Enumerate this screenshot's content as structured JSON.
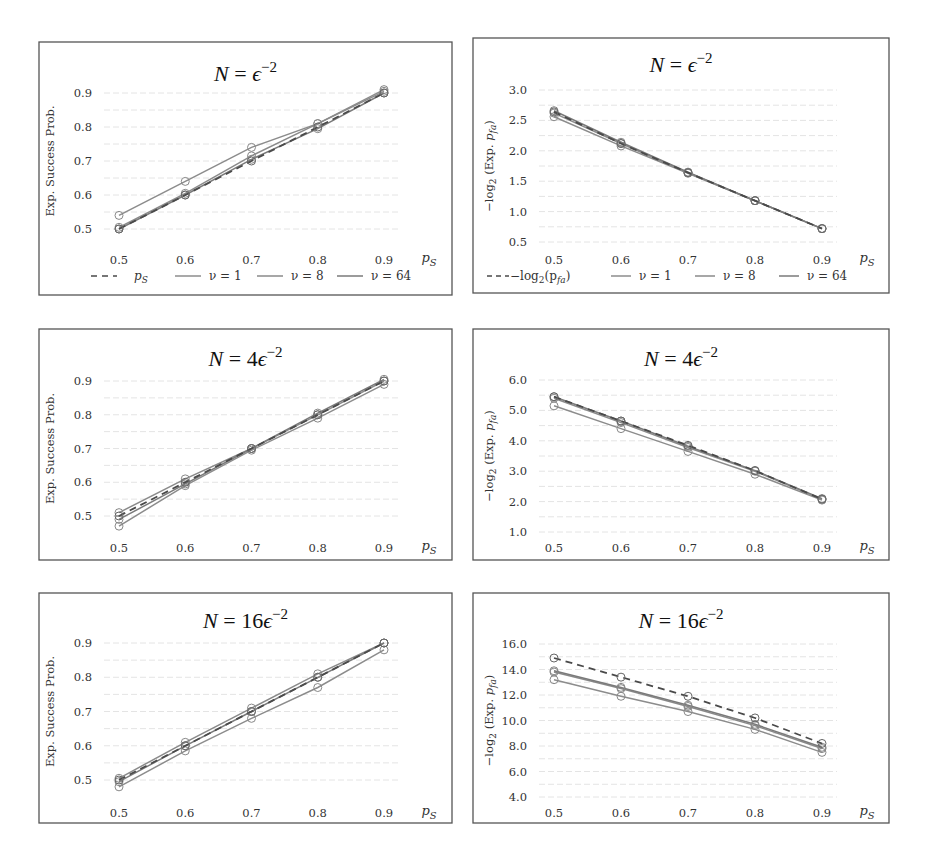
{
  "chart_data": [
    {
      "id": "success-eps2",
      "type": "line",
      "title": "N = ε^-2",
      "title_parts": {
        "lhs": "N",
        "eq": " = ",
        "coef": "",
        "sym": "ϵ",
        "exp": "−2"
      },
      "xlabel": "p_S",
      "ylabel": "Exp. Success Prob.",
      "x": [
        0.5,
        0.6,
        0.7,
        0.8,
        0.9
      ],
      "xticks": [
        "0.5",
        "0.6",
        "0.7",
        "0.8",
        "0.9"
      ],
      "yticks": [
        "0.5",
        "0.6",
        "0.7",
        "0.8",
        "0.9"
      ],
      "ylim": [
        0.45,
        0.95
      ],
      "grid": true,
      "legend_visible": true,
      "series": [
        {
          "name": "p_S",
          "style": "dashed",
          "values": [
            0.5,
            0.6,
            0.7,
            0.8,
            0.9
          ]
        },
        {
          "name": "ν = 1",
          "style": "solid",
          "values": [
            0.54,
            0.64,
            0.74,
            0.81,
            0.91
          ]
        },
        {
          "name": "ν = 8",
          "style": "solid",
          "values": [
            0.505,
            0.605,
            0.715,
            0.81,
            0.905
          ]
        },
        {
          "name": "ν = 64",
          "style": "solid",
          "values": [
            0.5,
            0.6,
            0.705,
            0.795,
            0.9
          ]
        }
      ]
    },
    {
      "id": "pfa-eps2",
      "type": "line",
      "title": "N = ε^-2",
      "title_parts": {
        "lhs": "N",
        "eq": " = ",
        "coef": "",
        "sym": "ϵ",
        "exp": "−2"
      },
      "xlabel": "p_S",
      "ylabel": "−log2 (Exp. p_fa)",
      "x": [
        0.5,
        0.6,
        0.7,
        0.8,
        0.9
      ],
      "xticks": [
        "0.5",
        "0.6",
        "0.7",
        "0.8",
        "0.9"
      ],
      "yticks": [
        "0.5",
        "1.0",
        "1.5",
        "2.0",
        "2.5",
        "3.0"
      ],
      "ylim": [
        0.5,
        3.0
      ],
      "grid": true,
      "legend_visible": true,
      "series": [
        {
          "name": "−log2(p_fa)",
          "style": "dashed",
          "values": [
            2.64,
            2.12,
            1.64,
            1.18,
            0.72
          ]
        },
        {
          "name": "ν = 1",
          "style": "solid",
          "values": [
            2.56,
            2.08,
            1.63,
            1.18,
            0.72
          ]
        },
        {
          "name": "ν = 8",
          "style": "solid",
          "values": [
            2.62,
            2.12,
            1.64,
            1.18,
            0.72
          ]
        },
        {
          "name": "ν = 64",
          "style": "solid",
          "values": [
            2.66,
            2.14,
            1.65,
            1.18,
            0.72
          ]
        }
      ]
    },
    {
      "id": "success-4eps2",
      "type": "line",
      "title": "N = 4ε^-2",
      "title_parts": {
        "lhs": "N",
        "eq": " = ",
        "coef": "4",
        "sym": "ϵ",
        "exp": "−2"
      },
      "xlabel": "p_S",
      "ylabel": "Exp. Success Prob.",
      "x": [
        0.5,
        0.6,
        0.7,
        0.8,
        0.9
      ],
      "xticks": [
        "0.5",
        "0.6",
        "0.7",
        "0.8",
        "0.9"
      ],
      "yticks": [
        "0.5",
        "0.6",
        "0.7",
        "0.8",
        "0.9"
      ],
      "ylim": [
        0.45,
        0.95
      ],
      "grid": true,
      "legend_visible": false,
      "series": [
        {
          "name": "p_S",
          "style": "dashed",
          "values": [
            0.5,
            0.6,
            0.7,
            0.8,
            0.9
          ]
        },
        {
          "name": "ν = 1",
          "style": "solid",
          "values": [
            0.47,
            0.59,
            0.695,
            0.79,
            0.89
          ]
        },
        {
          "name": "ν = 8",
          "style": "solid",
          "values": [
            0.51,
            0.61,
            0.7,
            0.8,
            0.9
          ]
        },
        {
          "name": "ν = 64",
          "style": "solid",
          "values": [
            0.49,
            0.595,
            0.7,
            0.805,
            0.905
          ]
        }
      ]
    },
    {
      "id": "pfa-4eps2",
      "type": "line",
      "title": "N = 4ε^-2",
      "title_parts": {
        "lhs": "N",
        "eq": " = ",
        "coef": "4",
        "sym": "ϵ",
        "exp": "−2"
      },
      "xlabel": "p_S",
      "ylabel": "−log2 (Exp. p_fa)",
      "x": [
        0.5,
        0.6,
        0.7,
        0.8,
        0.9
      ],
      "xticks": [
        "0.5",
        "0.6",
        "0.7",
        "0.8",
        "0.9"
      ],
      "yticks": [
        "1.0",
        "2.0",
        "3.0",
        "4.0",
        "5.0",
        "6.0"
      ],
      "ylim": [
        1.0,
        6.0
      ],
      "grid": true,
      "legend_visible": false,
      "series": [
        {
          "name": "−log2(p_fa)",
          "style": "dashed",
          "values": [
            5.45,
            4.65,
            3.85,
            3.02,
            2.08
          ]
        },
        {
          "name": "ν = 1",
          "style": "solid",
          "values": [
            5.15,
            4.4,
            3.65,
            2.9,
            2.05
          ]
        },
        {
          "name": "ν = 8",
          "style": "solid",
          "values": [
            5.4,
            4.6,
            3.78,
            3.0,
            2.08
          ]
        },
        {
          "name": "ν = 64",
          "style": "solid",
          "values": [
            5.45,
            4.65,
            3.82,
            3.02,
            2.1
          ]
        }
      ]
    },
    {
      "id": "success-16eps2",
      "type": "line",
      "title": "N = 16ε^-2",
      "title_parts": {
        "lhs": "N",
        "eq": " = ",
        "coef": "16",
        "sym": "ϵ",
        "exp": "−2"
      },
      "xlabel": "p_S",
      "ylabel": "Exp. Success Prob.",
      "x": [
        0.5,
        0.6,
        0.7,
        0.8,
        0.9
      ],
      "xticks": [
        "0.5",
        "0.6",
        "0.7",
        "0.8",
        "0.9"
      ],
      "yticks": [
        "0.5",
        "0.6",
        "0.7",
        "0.8",
        "0.9"
      ],
      "ylim": [
        0.45,
        0.95
      ],
      "grid": true,
      "legend_visible": false,
      "series": [
        {
          "name": "p_S",
          "style": "dashed",
          "values": [
            0.5,
            0.6,
            0.7,
            0.8,
            0.9
          ]
        },
        {
          "name": "ν = 1",
          "style": "solid",
          "values": [
            0.48,
            0.585,
            0.68,
            0.77,
            0.88
          ]
        },
        {
          "name": "ν = 8",
          "style": "solid",
          "values": [
            0.505,
            0.61,
            0.71,
            0.81,
            0.9
          ]
        },
        {
          "name": "ν = 64",
          "style": "solid",
          "values": [
            0.495,
            0.6,
            0.7,
            0.8,
            0.9
          ]
        }
      ]
    },
    {
      "id": "pfa-16eps2",
      "type": "line",
      "title": "N = 16ε^-2",
      "title_parts": {
        "lhs": "N",
        "eq": " = ",
        "coef": "16",
        "sym": "ϵ",
        "exp": "−2"
      },
      "xlabel": "p_S",
      "ylabel": "−log2 (Exp. p_fa)",
      "x": [
        0.5,
        0.6,
        0.7,
        0.8,
        0.9
      ],
      "xticks": [
        "0.5",
        "0.6",
        "0.7",
        "0.8",
        "0.9"
      ],
      "yticks": [
        "4.0",
        "6.0",
        "8.0",
        "10.0",
        "12.0",
        "14.0",
        "16.0"
      ],
      "ylim": [
        4.0,
        16.0
      ],
      "grid": true,
      "legend_visible": false,
      "series": [
        {
          "name": "−log2(p_fa)",
          "style": "dashed",
          "values": [
            14.9,
            13.4,
            11.9,
            10.2,
            8.2
          ]
        },
        {
          "name": "ν = 1",
          "style": "solid",
          "values": [
            13.2,
            11.9,
            10.7,
            9.3,
            7.5
          ]
        },
        {
          "name": "ν = 8",
          "style": "solid",
          "values": [
            13.8,
            12.5,
            11.1,
            9.6,
            7.8
          ]
        },
        {
          "name": "ν = 64",
          "style": "solid",
          "values": [
            13.9,
            12.6,
            11.2,
            9.7,
            7.9
          ]
        }
      ]
    }
  ],
  "legends": {
    "success": {
      "dashed_label": "p",
      "dashed_sub": "S",
      "items": [
        "ν = 1",
        "ν = 8",
        "ν = 64"
      ]
    },
    "pfa": {
      "dashed_label": "−log",
      "dashed_sub": "2",
      "dashed_arg": "(p",
      "dashed_arg_sub": "fa",
      "dashed_close": ")",
      "items": [
        "ν = 1",
        "ν = 8",
        "ν = 64"
      ]
    }
  },
  "axis_labels": {
    "x_main": "p",
    "x_sub": "S",
    "y_success": "Exp. Success Prob.",
    "y_pfa_prefix": "−log",
    "y_pfa_sub": "2",
    "y_pfa_mid": " (Exp. ",
    "y_pfa_p": "p",
    "y_pfa_psub": "fa",
    "y_pfa_close": ")"
  },
  "colors": {
    "frame": "#555555",
    "dashed": "#4a4a4a",
    "nu1": "#8c8c8c",
    "nu8": "#8a8a8a",
    "nu64": "#7a7a7a",
    "marker": "#888888",
    "grid": "#e4e4e4"
  }
}
